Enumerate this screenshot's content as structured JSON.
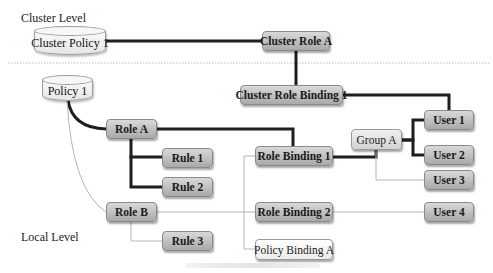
{
  "levels": {
    "cluster": "Cluster Level",
    "local": "Local Level"
  },
  "nodes": {
    "cluster_policy_1": "Cluster Policy 1",
    "cluster_role_a": "Cluster Role A",
    "cluster_role_binding_1": "Cluster Role Binding 1",
    "policy_1": "Policy 1",
    "role_a": "Role A",
    "role_b": "Role B",
    "rule_1": "Rule 1",
    "rule_2": "Rule 2",
    "rule_3": "Rule 3",
    "role_binding_1": "Role Binding 1",
    "role_binding_2": "Role Binding 2",
    "policy_binding_a": "Policy Binding A",
    "group_a": "Group A",
    "user_1": "User 1",
    "user_2": "User 2",
    "user_3": "User 3",
    "user_4": "User 4"
  },
  "edges": [
    {
      "from": "Cluster Policy 1",
      "to": "Cluster Role A",
      "style": "thick"
    },
    {
      "from": "Cluster Role A",
      "to": "Cluster Role Binding 1",
      "style": "thick"
    },
    {
      "from": "Cluster Role Binding 1",
      "to": "User 1",
      "style": "thick"
    },
    {
      "from": "Policy 1",
      "to": "Role A",
      "style": "thick"
    },
    {
      "from": "Policy 1",
      "to": "Role B",
      "style": "thin"
    },
    {
      "from": "Role A",
      "to": "Rule 1",
      "style": "thick"
    },
    {
      "from": "Role A",
      "to": "Rule 2",
      "style": "thick"
    },
    {
      "from": "Role A",
      "to": "Role Binding 1",
      "style": "thick"
    },
    {
      "from": "Role B",
      "to": "Rule 3",
      "style": "thin"
    },
    {
      "from": "Role B",
      "to": "Role Binding 2",
      "style": "thin"
    },
    {
      "from": "Role Binding 1",
      "to": "Group A",
      "style": "thick"
    },
    {
      "from": "Group A",
      "to": "User 1",
      "style": "thick"
    },
    {
      "from": "Group A",
      "to": "User 2",
      "style": "thick"
    },
    {
      "from": "Group A",
      "to": "User 3",
      "style": "thin"
    },
    {
      "from": "Role Binding 2",
      "to": "User 4",
      "style": "thin"
    },
    {
      "from": "Role Binding 1",
      "to": "Policy Binding A",
      "style": "thin"
    }
  ],
  "colors": {
    "thick_edge": "#1e1e1e",
    "thin_edge": "#b5b5b5",
    "divider": "#bdbdbd"
  }
}
